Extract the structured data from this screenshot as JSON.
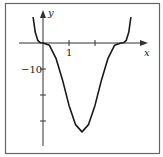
{
  "chart_data": {
    "type": "line",
    "title": "",
    "xlabel": "x",
    "ylabel": "y",
    "x_ticks": [
      1,
      2
    ],
    "x_tick_labels": [
      "1"
    ],
    "y_ticks": [
      -10,
      -20,
      -30
    ],
    "y_tick_labels": [
      "−10"
    ],
    "xlim": [
      -0.9,
      3.9
    ],
    "ylim": [
      -39,
      13
    ],
    "grid": false,
    "legend": null,
    "series": [
      {
        "name": "curve",
        "description": "Flat inflection at x=0, minimum near x=1.5 (about -34), flat inflection near x=3, rising steeply at both ends",
        "x": [
          -0.38,
          -0.3,
          -0.2,
          -0.1,
          0,
          0.25,
          0.5,
          0.75,
          1.0,
          1.25,
          1.5,
          1.75,
          2.0,
          2.25,
          2.5,
          2.75,
          3.0,
          3.1,
          3.2,
          3.3,
          3.38
        ],
        "y": [
          10.0,
          4.2,
          1.0,
          0.08,
          0,
          -0.9,
          -5.9,
          -14.2,
          -24.0,
          -31.4,
          -34.2,
          -31.4,
          -24.0,
          -14.2,
          -5.9,
          -0.9,
          0,
          0.08,
          1.0,
          4.2,
          10.0
        ]
      }
    ]
  },
  "labels": {
    "x_axis": "x",
    "y_axis": "y",
    "x_tick_1": "1",
    "y_tick_neg10": "−10"
  },
  "colors": {
    "curve": "#1a1a1a",
    "axes": "#333333",
    "frame": "#555555",
    "background": "#ffffff"
  }
}
